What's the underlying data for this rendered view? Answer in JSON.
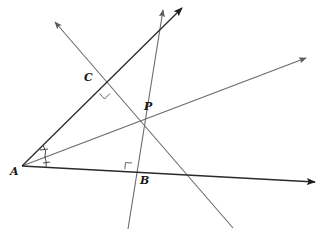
{
  "diagram": {
    "type": "geometry",
    "points": {
      "A": {
        "label": "A",
        "x": 22,
        "y": 166
      },
      "P": {
        "label": "P",
        "x": 136,
        "y": 117
      },
      "C": {
        "label": "C",
        "x": 104,
        "y": 88
      },
      "B": {
        "label": "B",
        "x": 131,
        "y": 172
      }
    },
    "labels": {
      "A": "A",
      "P": "P",
      "C": "C",
      "B": "B"
    },
    "rays": [
      {
        "name": "side-upper",
        "from": "A",
        "to": [
          182,
          8
        ],
        "arrow": true,
        "color": "#2a2a2a"
      },
      {
        "name": "side-lower",
        "from": "A",
        "to": [
          316,
          182
        ],
        "arrow": true,
        "color": "#2a2a2a"
      },
      {
        "name": "bisector",
        "from": "A",
        "to": [
          307,
          58
        ],
        "arrow": true,
        "color": "#6a6a6a"
      }
    ],
    "lines": [
      {
        "name": "perpendicular-through-C",
        "from": [
          52,
          19
        ],
        "to": [
          233,
          228
        ],
        "arrow_at_start": true,
        "color": "#6a6a6a"
      },
      {
        "name": "perpendicular-through-B",
        "from": [
          163,
          12
        ],
        "to": [
          128,
          229
        ],
        "color": "#6a6a6a"
      }
    ],
    "marks": {
      "right_angles": [
        "C",
        "B"
      ],
      "equal_angle_ticks": "A"
    },
    "colors": {
      "dark_line": "#2a2a2a",
      "light_line": "#6a6a6a",
      "label": "#1a1a1a"
    }
  }
}
